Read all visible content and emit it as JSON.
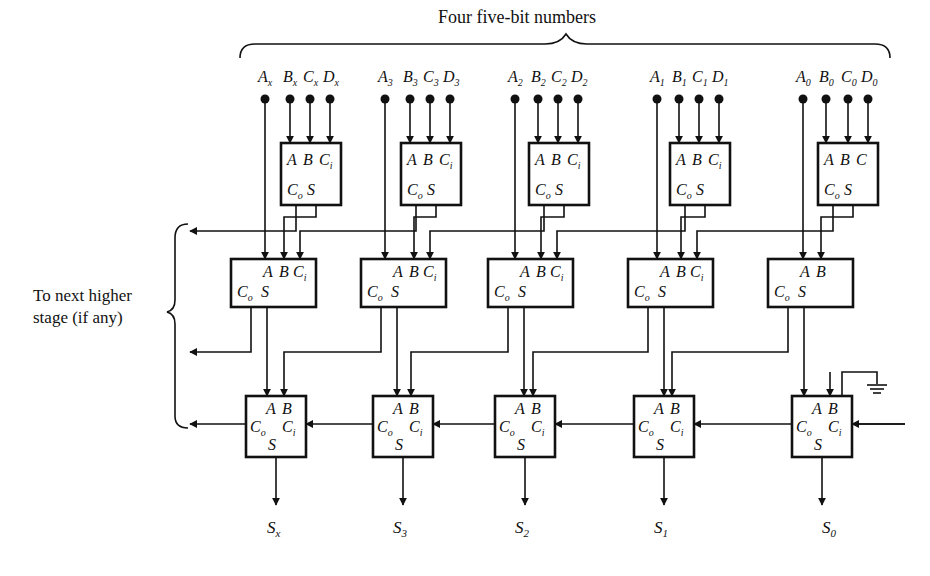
{
  "figure": {
    "title": "Four five-bit numbers",
    "side_label_line1": "To next higher",
    "side_label_line2": "stage (if any)"
  },
  "columns": [
    {
      "id": "x",
      "inputs": {
        "A": "A",
        "A_sub": "x",
        "B": "B",
        "B_sub": "x",
        "C": "C",
        "C_sub": "x",
        "D": "D",
        "D_sub": "x"
      },
      "sum": {
        "S": "S",
        "sub": "x"
      }
    },
    {
      "id": "3",
      "inputs": {
        "A": "A",
        "A_sub": "3",
        "B": "B",
        "B_sub": "3",
        "C": "C",
        "C_sub": "3",
        "D": "D",
        "D_sub": "3"
      },
      "sum": {
        "S": "S",
        "sub": "3"
      }
    },
    {
      "id": "2",
      "inputs": {
        "A": "A",
        "A_sub": "2",
        "B": "B",
        "B_sub": "2",
        "C": "C",
        "C_sub": "2",
        "D": "D",
        "D_sub": "2"
      },
      "sum": {
        "S": "S",
        "sub": "2"
      }
    },
    {
      "id": "1",
      "inputs": {
        "A": "A",
        "A_sub": "1",
        "B": "B",
        "B_sub": "1",
        "C": "C",
        "C_sub": "1",
        "D": "D",
        "D_sub": "1"
      },
      "sum": {
        "S": "S",
        "sub": "1"
      }
    },
    {
      "id": "0",
      "inputs": {
        "A": "A",
        "A_sub": "0",
        "B": "B",
        "B_sub": "0",
        "C": "C",
        "C_sub": "0",
        "D": "D",
        "D_sub": "0"
      },
      "sum": {
        "S": "S",
        "sub": "0"
      }
    }
  ],
  "adder_labels": {
    "A": "A",
    "B": "B",
    "C": "C",
    "Ci_sub": "i",
    "Co_sub": "o",
    "S": "S"
  },
  "ground_icon": "ground-symbol"
}
